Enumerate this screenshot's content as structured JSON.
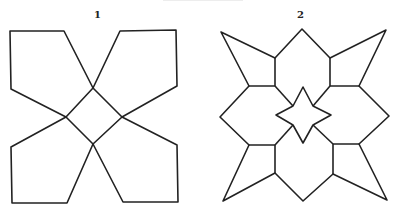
{
  "figures": [
    {
      "label": "1",
      "shape": "four pentagons meeting around a central square"
    },
    {
      "label": "2",
      "shape": "eight-pointed pattern with central four-pointed star"
    }
  ]
}
